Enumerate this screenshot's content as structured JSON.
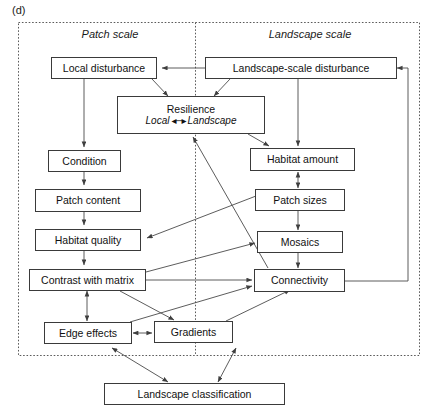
{
  "figure": {
    "panel_label": "(d)",
    "scale_headers": [
      {
        "name": "patch-scale-header",
        "label": "Patch scale"
      },
      {
        "name": "landscape-scale-header",
        "label": "Landscape scale"
      }
    ]
  },
  "nodes": [
    {
      "id": "local-disturbance",
      "label": "Local disturbance",
      "column": "patch"
    },
    {
      "id": "landscape-scale-disturbance",
      "label": "Landscape-scale disturbance",
      "column": "landscape"
    },
    {
      "id": "resilience",
      "label": "Resilience",
      "sub_left": "Local",
      "sub_arrow": "◂─▸",
      "sub_right": "Landscape",
      "column": "both"
    },
    {
      "id": "condition",
      "label": "Condition",
      "column": "patch"
    },
    {
      "id": "patch-content",
      "label": "Patch content",
      "column": "patch"
    },
    {
      "id": "habitat-quality",
      "label": "Habitat quality",
      "column": "patch"
    },
    {
      "id": "contrast-with-matrix",
      "label": "Contrast with matrix",
      "column": "patch"
    },
    {
      "id": "habitat-amount",
      "label": "Habitat amount",
      "column": "landscape"
    },
    {
      "id": "patch-sizes",
      "label": "Patch sizes",
      "column": "landscape"
    },
    {
      "id": "mosaics",
      "label": "Mosaics",
      "column": "landscape"
    },
    {
      "id": "connectivity",
      "label": "Connectivity",
      "column": "landscape"
    },
    {
      "id": "edge-effects",
      "label": "Edge effects",
      "column": "patch"
    },
    {
      "id": "gradients",
      "label": "Gradients",
      "column": "landscape"
    },
    {
      "id": "landscape-classification",
      "label": "Landscape classification",
      "column": "outside"
    }
  ],
  "edges": [
    {
      "from": "landscape-scale-disturbance",
      "to": "local-disturbance",
      "style": "single"
    },
    {
      "from": "local-disturbance",
      "to": "resilience",
      "style": "single"
    },
    {
      "from": "landscape-scale-disturbance",
      "to": "resilience",
      "style": "single"
    },
    {
      "from": "local-disturbance",
      "to": "condition",
      "style": "single"
    },
    {
      "from": "condition",
      "to": "patch-content",
      "style": "single"
    },
    {
      "from": "patch-content",
      "to": "habitat-quality",
      "style": "single"
    },
    {
      "from": "habitat-quality",
      "to": "contrast-with-matrix",
      "style": "single"
    },
    {
      "from": "resilience",
      "to": "habitat-amount",
      "style": "single"
    },
    {
      "from": "landscape-scale-disturbance",
      "to": "habitat-amount",
      "style": "single"
    },
    {
      "from": "habitat-amount",
      "to": "patch-sizes",
      "style": "double"
    },
    {
      "from": "patch-sizes",
      "to": "mosaics",
      "style": "single"
    },
    {
      "from": "mosaics",
      "to": "connectivity",
      "style": "single"
    },
    {
      "from": "patch-sizes",
      "to": "habitat-quality",
      "style": "single"
    },
    {
      "from": "contrast-with-matrix",
      "to": "mosaics",
      "style": "single"
    },
    {
      "from": "contrast-with-matrix",
      "to": "connectivity",
      "style": "single"
    },
    {
      "from": "connectivity",
      "to": "resilience",
      "style": "single"
    },
    {
      "from": "contrast-with-matrix",
      "to": "edge-effects",
      "style": "double"
    },
    {
      "from": "contrast-with-matrix",
      "to": "gradients",
      "style": "single"
    },
    {
      "from": "edge-effects",
      "to": "gradients",
      "style": "double"
    },
    {
      "from": "gradients",
      "to": "connectivity",
      "style": "single"
    },
    {
      "from": "connectivity",
      "to": "landscape-scale-disturbance",
      "style": "single"
    },
    {
      "from": "edge-effects",
      "to": "landscape-classification",
      "style": "double"
    },
    {
      "from": "gradients",
      "to": "landscape-classification",
      "style": "double"
    }
  ],
  "colors": {
    "box_border": "#3a3a3a",
    "wire": "#4a4a4a",
    "dashed_border": "#555555",
    "text": "#111111",
    "background": "#ffffff"
  }
}
